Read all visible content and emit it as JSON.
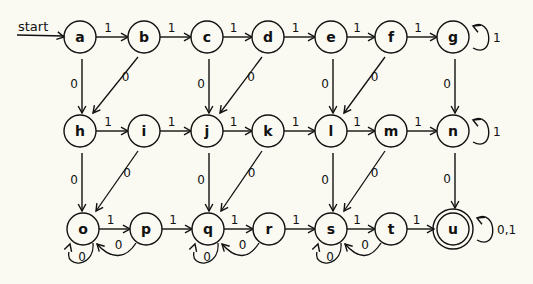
{
  "diagram": {
    "type": "finite-state-automaton",
    "start_label": "start",
    "start_state": "a",
    "accept_states": [
      "u"
    ],
    "colors": {
      "background": "#fbfaf2",
      "stroke": "#111111"
    },
    "states": [
      {
        "id": "a",
        "label": "a",
        "x": 80,
        "y": 37
      },
      {
        "id": "b",
        "label": "b",
        "x": 144,
        "y": 37
      },
      {
        "id": "c",
        "label": "c",
        "x": 207,
        "y": 37
      },
      {
        "id": "d",
        "label": "d",
        "x": 268,
        "y": 37
      },
      {
        "id": "e",
        "label": "e",
        "x": 331,
        "y": 37
      },
      {
        "id": "f",
        "label": "f",
        "x": 391,
        "y": 37
      },
      {
        "id": "g",
        "label": "g",
        "x": 453,
        "y": 37
      },
      {
        "id": "h",
        "label": "h",
        "x": 80,
        "y": 131
      },
      {
        "id": "i",
        "label": "i",
        "x": 144,
        "y": 131
      },
      {
        "id": "j",
        "label": "j",
        "x": 207,
        "y": 131
      },
      {
        "id": "k",
        "label": "k",
        "x": 268,
        "y": 131
      },
      {
        "id": "l",
        "label": "l",
        "x": 331,
        "y": 131
      },
      {
        "id": "m",
        "label": "m",
        "x": 391,
        "y": 131
      },
      {
        "id": "n",
        "label": "n",
        "x": 453,
        "y": 131
      },
      {
        "id": "o",
        "label": "o",
        "x": 83,
        "y": 229
      },
      {
        "id": "p",
        "label": "p",
        "x": 146,
        "y": 229
      },
      {
        "id": "q",
        "label": "q",
        "x": 208,
        "y": 229
      },
      {
        "id": "r",
        "label": "r",
        "x": 269,
        "y": 229
      },
      {
        "id": "s",
        "label": "s",
        "x": 331,
        "y": 229
      },
      {
        "id": "t",
        "label": "t",
        "x": 391,
        "y": 229
      },
      {
        "id": "u",
        "label": "u",
        "x": 453,
        "y": 229,
        "accepting": true
      }
    ],
    "transitions": [
      {
        "from": "a",
        "to": "b",
        "label": "1",
        "kind": "right"
      },
      {
        "from": "b",
        "to": "c",
        "label": "1",
        "kind": "right"
      },
      {
        "from": "c",
        "to": "d",
        "label": "1",
        "kind": "right"
      },
      {
        "from": "d",
        "to": "e",
        "label": "1",
        "kind": "right"
      },
      {
        "from": "e",
        "to": "f",
        "label": "1",
        "kind": "right"
      },
      {
        "from": "f",
        "to": "g",
        "label": "1",
        "kind": "right"
      },
      {
        "from": "g",
        "to": "g",
        "label": "1",
        "kind": "self-right"
      },
      {
        "from": "h",
        "to": "i",
        "label": "1",
        "kind": "right"
      },
      {
        "from": "i",
        "to": "j",
        "label": "1",
        "kind": "right"
      },
      {
        "from": "j",
        "to": "k",
        "label": "1",
        "kind": "right"
      },
      {
        "from": "k",
        "to": "l",
        "label": "1",
        "kind": "right"
      },
      {
        "from": "l",
        "to": "m",
        "label": "1",
        "kind": "right"
      },
      {
        "from": "m",
        "to": "n",
        "label": "1",
        "kind": "right"
      },
      {
        "from": "n",
        "to": "n",
        "label": "1",
        "kind": "self-right"
      },
      {
        "from": "o",
        "to": "p",
        "label": "1",
        "kind": "right"
      },
      {
        "from": "p",
        "to": "q",
        "label": "1",
        "kind": "right"
      },
      {
        "from": "q",
        "to": "r",
        "label": "1",
        "kind": "right"
      },
      {
        "from": "r",
        "to": "s",
        "label": "1",
        "kind": "right"
      },
      {
        "from": "s",
        "to": "t",
        "label": "1",
        "kind": "right"
      },
      {
        "from": "t",
        "to": "u",
        "label": "1",
        "kind": "right"
      },
      {
        "from": "u",
        "to": "u",
        "label": "0,1",
        "kind": "self-right"
      },
      {
        "from": "a",
        "to": "h",
        "label": "0",
        "kind": "down"
      },
      {
        "from": "b",
        "to": "h",
        "label": "0",
        "kind": "diag"
      },
      {
        "from": "c",
        "to": "j",
        "label": "0",
        "kind": "down"
      },
      {
        "from": "d",
        "to": "j",
        "label": "0",
        "kind": "diag"
      },
      {
        "from": "e",
        "to": "l",
        "label": "0",
        "kind": "down"
      },
      {
        "from": "f",
        "to": "l",
        "label": "0",
        "kind": "diag"
      },
      {
        "from": "g",
        "to": "n",
        "label": "0",
        "kind": "down"
      },
      {
        "from": "h",
        "to": "o",
        "label": "0",
        "kind": "down"
      },
      {
        "from": "i",
        "to": "o",
        "label": "0",
        "kind": "diag"
      },
      {
        "from": "j",
        "to": "q",
        "label": "0",
        "kind": "down"
      },
      {
        "from": "k",
        "to": "q",
        "label": "0",
        "kind": "diag"
      },
      {
        "from": "l",
        "to": "s",
        "label": "0",
        "kind": "down"
      },
      {
        "from": "m",
        "to": "s",
        "label": "0",
        "kind": "diag"
      },
      {
        "from": "n",
        "to": "u",
        "label": "0",
        "kind": "down"
      },
      {
        "from": "o",
        "to": "o",
        "label": "0",
        "kind": "self-below"
      },
      {
        "from": "p",
        "to": "o",
        "label": "0",
        "kind": "back-arc"
      },
      {
        "from": "q",
        "to": "q",
        "label": "0",
        "kind": "self-below"
      },
      {
        "from": "r",
        "to": "q",
        "label": "0",
        "kind": "back-arc"
      },
      {
        "from": "s",
        "to": "s",
        "label": "0",
        "kind": "self-below"
      },
      {
        "from": "t",
        "to": "s",
        "label": "0",
        "kind": "back-arc"
      }
    ]
  }
}
